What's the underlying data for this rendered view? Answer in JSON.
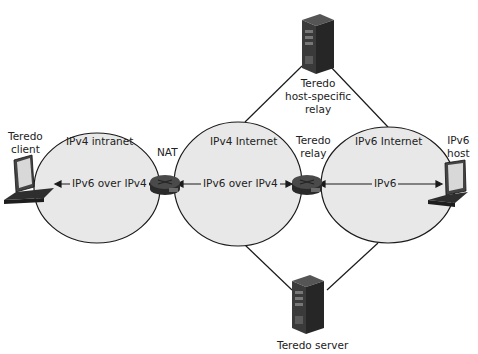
{
  "diagram": {
    "networks": [
      {
        "id": "ipv4-intranet",
        "label": "IPv4 intranet"
      },
      {
        "id": "ipv4-internet",
        "label": "IPv4 Internet"
      },
      {
        "id": "ipv6-internet",
        "label": "IPv6 Internet"
      }
    ],
    "nodes": {
      "teredo_client": {
        "label_line1": "Teredo",
        "label_line2": "client"
      },
      "nat": {
        "label": "NAT"
      },
      "teredo_relay": {
        "label_line1": "Teredo",
        "label_line2": "relay"
      },
      "ipv6_host": {
        "label_line1": "IPv6",
        "label_line2": "host"
      },
      "host_specific_relay": {
        "label_line1": "Teredo",
        "label_line2": "host-specific",
        "label_line3": "relay"
      },
      "teredo_server": {
        "label": "Teredo server"
      }
    },
    "links": [
      {
        "from": "teredo_client",
        "to": "nat",
        "label": "IPv6 over IPv4"
      },
      {
        "from": "nat",
        "to": "teredo_relay",
        "label": "IPv6 over IPv4"
      },
      {
        "from": "teredo_relay",
        "to": "ipv6_host",
        "label": "IPv6"
      }
    ],
    "colors": {
      "network_fill": "#e8e8e8",
      "outline": "#1a1a1a",
      "device_dark": "#3a3a3a"
    }
  }
}
